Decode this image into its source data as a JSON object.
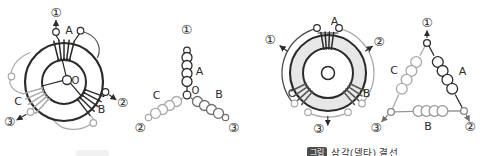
{
  "palette": {
    "ink": "#2b2b2b",
    "mid": "#6e6e6e",
    "light": "#a9a9a9",
    "band": "#e7e7e7",
    "background": "#ffffff"
  },
  "y_stator": {
    "phase_a": "A",
    "phase_b": "B",
    "phase_c": "C",
    "neutral": "O",
    "terminal_1": "①",
    "terminal_2": "②",
    "terminal_3": "③"
  },
  "y_schematic": {
    "phase_a": "A",
    "phase_b": "B",
    "phase_c": "C",
    "neutral": "O",
    "terminal_1": "①",
    "terminal_2": "②",
    "terminal_3": "③"
  },
  "delta_stator": {
    "phase_a": "A",
    "phase_b": "B",
    "phase_c": "C",
    "terminal_1": "①",
    "terminal_2": "②",
    "terminal_3": "③"
  },
  "delta_schematic": {
    "phase_a": "A",
    "phase_b": "B",
    "phase_c": "C",
    "terminal_1": "①",
    "terminal_2": "②",
    "terminal_3": "③"
  },
  "caption_right": {
    "tag": "그림",
    "text": "삼각(델타) 결선"
  },
  "caption_left": {
    "tag": ""
  }
}
